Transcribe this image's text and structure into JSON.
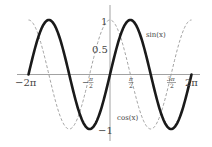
{
  "chart_data": {
    "type": "line",
    "title": "",
    "xlabel": "",
    "ylabel": "",
    "xlim": [
      -6.2832,
      6.2832
    ],
    "ylim": [
      -1,
      1
    ],
    "grid": false,
    "legend": "inline annotations",
    "x_ticks": [
      {
        "value": -6.2832,
        "label": "−2π"
      },
      {
        "value": -1.5708,
        "label": "−π/2"
      },
      {
        "value": 1.5708,
        "label": "π/2"
      },
      {
        "value": 4.7124,
        "label": "3π/2"
      },
      {
        "value": 6.2832,
        "label": "2π"
      }
    ],
    "y_ticks": [
      {
        "value": 1,
        "label": "1"
      },
      {
        "value": 0.5,
        "label": "0.5"
      },
      {
        "value": -1,
        "label": "−1"
      }
    ],
    "series": [
      {
        "name": "sin(x)",
        "function": "sin",
        "style": "solid thick",
        "color": "#1a1a1a",
        "x": [
          -6.2832,
          -4.7124,
          -3.1416,
          -1.5708,
          0,
          1.5708,
          3.1416,
          4.7124,
          6.2832
        ],
        "values": [
          0,
          1,
          0,
          -1,
          0,
          1,
          0,
          -1,
          0
        ]
      },
      {
        "name": "cos(x)",
        "function": "cos",
        "style": "dashed thin",
        "color": "#999999",
        "x": [
          -6.2832,
          -4.7124,
          -3.1416,
          -1.5708,
          0,
          1.5708,
          3.1416,
          4.7124,
          6.2832
        ],
        "values": [
          1,
          0,
          -1,
          0,
          1,
          0,
          -1,
          0,
          1
        ]
      }
    ],
    "annotations": [
      {
        "text": "sin(x)",
        "near": "right peak"
      },
      {
        "text": "cos(x)",
        "near": "lower middle"
      }
    ]
  },
  "labels": {
    "x": {
      "neg2pi": "−2π",
      "negpi2_sign": "−",
      "pi": "π",
      "two": "2",
      "three_pi": "3π",
      "pos2pi": "2π"
    },
    "y": {
      "one": "1",
      "half": "0.5",
      "negone": "−1"
    },
    "sin": "sin(x)",
    "cos": "cos(x)"
  },
  "colors": {
    "axis": "#888888",
    "sin": "#1a1a1a",
    "cos": "#9a9a9a",
    "text": "#444444"
  }
}
